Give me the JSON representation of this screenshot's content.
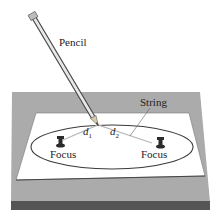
{
  "diagram": {
    "labels": {
      "pencil": "Pencil",
      "string": "String",
      "focus_left": "Focus",
      "focus_right": "Focus",
      "d1_var": "d",
      "d1_sub": "1",
      "d2_var": "d",
      "d2_sub": "2"
    },
    "colors": {
      "board": "#a9a9a9",
      "board_edge": "#5a5a5a",
      "paper": "#ffffff",
      "ellipse": "#3a3a3a",
      "string": "#b0b0b0",
      "pin": "#2b2b2b"
    }
  }
}
